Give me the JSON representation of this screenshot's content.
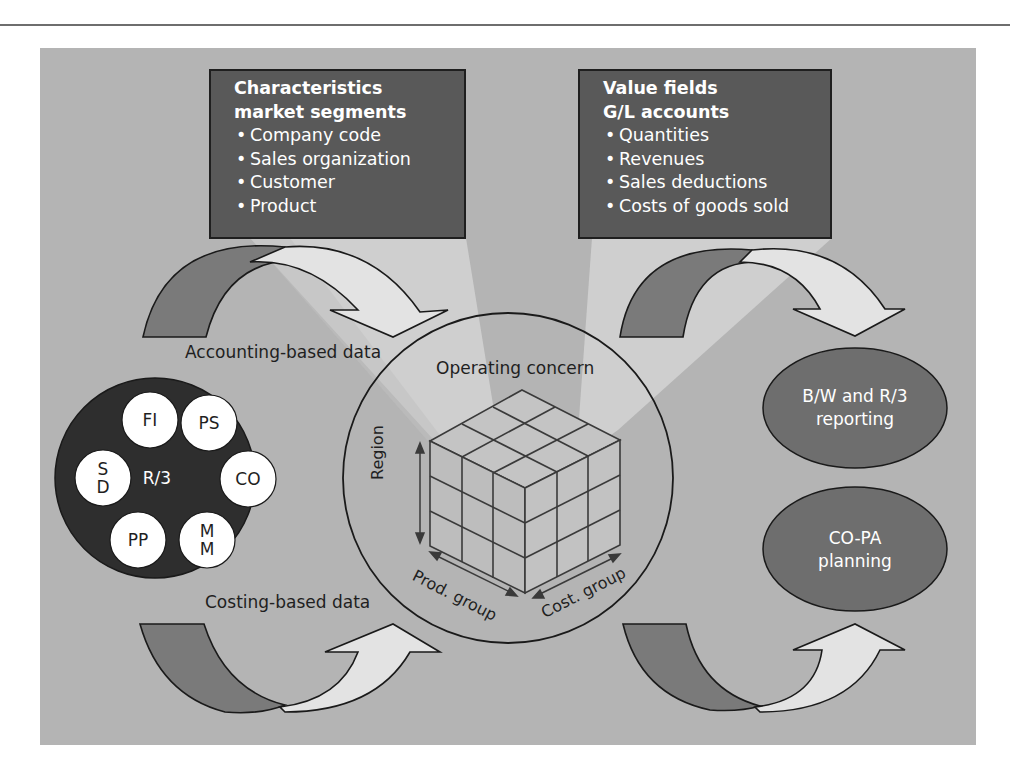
{
  "diagram": {
    "characteristics_box": {
      "title_line1": "Characteristics",
      "title_line2": "market segments",
      "items": [
        "Company code",
        "Sales organization",
        "Customer",
        "Product"
      ]
    },
    "value_fields_box": {
      "title_line1": "Value fields",
      "title_line2": "G/L accounts",
      "items": [
        "Quantities",
        "Revenues",
        "Sales deductions",
        "Costs of goods sold"
      ]
    },
    "flows": {
      "accounting_label": "Accounting-based data",
      "costing_label": "Costing-based data"
    },
    "r3_system": {
      "center_label": "R/3",
      "modules": [
        {
          "id": "fi",
          "label": "FI"
        },
        {
          "id": "ps",
          "label": "PS"
        },
        {
          "id": "co",
          "label": "CO"
        },
        {
          "id": "mm",
          "label_line1": "M",
          "label_line2": "M"
        },
        {
          "id": "pp",
          "label": "PP"
        },
        {
          "id": "sd",
          "label_line1": "S",
          "label_line2": "D"
        }
      ]
    },
    "operating_concern": {
      "title": "Operating concern",
      "axes": {
        "vertical": "Region",
        "left": "Prod. group",
        "right": "Cost. group"
      }
    },
    "outputs": [
      {
        "id": "reporting",
        "line1": "B/W and R/3",
        "line2": "reporting"
      },
      {
        "id": "planning",
        "line1": "CO-PA",
        "line2": "planning"
      }
    ],
    "colors": {
      "background_panel": "#b4b4b4",
      "dark_box": "#595959",
      "r3_circle": "#2e2e2e",
      "module_circle": "#ffffff",
      "output_ellipse": "#6e6e6e",
      "arrow_dark": "#7a7a7a",
      "arrow_light": "#e3e3e3",
      "cone_light": "#cdcdcd"
    }
  }
}
